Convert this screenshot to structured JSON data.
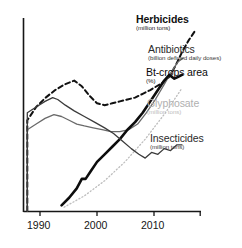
{
  "chart_data": {
    "type": "line",
    "title": "",
    "xlabel": "",
    "ylabel": "",
    "grid": false,
    "legend_position": "inline-right-of-line-ends",
    "xlim": [
      1988,
      2016
    ],
    "xticks": [
      1990,
      2000,
      2010
    ],
    "xtick_labels": [
      "1990",
      "2000",
      "2010"
    ],
    "ylim": [
      0,
      100
    ],
    "yticks": [],
    "ytick_labels": [],
    "note": "Unscaled/indexed vertical axis; each series plotted on its own arbitrary vertical scale with no y tick labels.",
    "series": [
      {
        "name": "Herbicides",
        "unit": "(million tons)",
        "style": "dashed",
        "color": "#111111",
        "width": 2.0,
        "label_color": "#111111",
        "label_bold": true,
        "x": [
          1988.6,
          1988.6,
          1990.0,
          1991.5,
          1993.0,
          1994.5,
          1996.0,
          1997.2,
          1998.4,
          1999.6,
          2000.8,
          2002.0,
          2003.2,
          2004.4,
          2005.6,
          2006.8,
          2008.0,
          2009.0,
          2010.0,
          2011.0,
          2012.0,
          2013.0,
          2014.0,
          2015.0
        ],
        "values": [
          0,
          48,
          55,
          60,
          64,
          67,
          69,
          66,
          61,
          57,
          56,
          57,
          58,
          59,
          60,
          62,
          64,
          66,
          68,
          71,
          77,
          84,
          90,
          95
        ]
      },
      {
        "name": "Antibiotics",
        "unit": "(billion defined daily doses)",
        "style": "solid",
        "color": "#6a6a6a",
        "width": 1.3,
        "label_color": "#2b2b2b",
        "label_bold": false,
        "x": [
          1988.6,
          1988.6,
          1990.0,
          1991.4,
          1992.8,
          1994.0,
          1995.2,
          1996.4,
          1997.6,
          1999.0,
          2000.4,
          2001.8,
          2003.2,
          2004.6,
          2006.0,
          2007.4,
          2008.8,
          2010.2,
          2011.4,
          2012.4,
          2013.2
        ],
        "values": [
          0,
          43,
          46,
          49,
          51,
          50,
          48,
          46,
          45,
          44,
          43,
          42,
          42,
          43,
          46,
          52,
          59,
          67,
          74,
          79,
          81
        ]
      },
      {
        "name": "Bt-crops area",
        "unit": "(%)",
        "style": "solid",
        "color": "#0d0d0d",
        "width": 2.6,
        "label_color": "#0a0a0a",
        "label_bold": false,
        "x": [
          1994.0,
          1995.2,
          1996.4,
          1997.2,
          1997.8,
          1998.6,
          1999.6,
          2000.8,
          2002.0,
          2003.2,
          2004.4,
          2005.6,
          2006.8,
          2008.0,
          2009.2,
          2010.2,
          2011.0,
          2011.8,
          2012.4,
          2013.0
        ],
        "values": [
          3,
          7,
          12,
          17,
          17,
          21,
          26,
          30,
          34,
          38,
          43,
          47,
          52,
          58,
          64,
          69,
          72,
          70,
          71,
          72
        ]
      },
      {
        "name": "Glyphosate",
        "unit": "(million tons)",
        "style": "dotted",
        "color": "#bdbdbd",
        "width": 1.3,
        "label_color": "#b0b0b0",
        "label_bold": false,
        "x": [
          1994.4,
          1996.0,
          1997.6,
          1999.2,
          2000.8,
          2002.4,
          2004.0,
          2005.6,
          2007.2,
          2008.8,
          2010.4,
          2012.0,
          2013.0
        ],
        "values": [
          2,
          5,
          8,
          12,
          16,
          21,
          26,
          32,
          38,
          45,
          52,
          60,
          65
        ]
      },
      {
        "name": "Insecticides",
        "unit": "(million tons)",
        "style": "solid",
        "color": "#3b3b3b",
        "width": 1.3,
        "label_color": "#2b2b2b",
        "label_bold": false,
        "x": [
          1988.6,
          1988.6,
          1990.0,
          1991.4,
          1992.6,
          1993.4,
          1994.6,
          1996.0,
          1997.6,
          1999.2,
          2000.8,
          2002.2,
          2003.6,
          2005.0,
          2006.2,
          2007.2,
          2008.2,
          2009.2,
          2010.2,
          2011.2,
          2012.2,
          2013.0
        ],
        "values": [
          0,
          52,
          55,
          58,
          60,
          59,
          56,
          53,
          50,
          47,
          44,
          41,
          37,
          33,
          30,
          28,
          31,
          30,
          33,
          32,
          35,
          35
        ]
      }
    ]
  },
  "axes": {
    "x_tick_labels": [
      "1990",
      "2000",
      "2010"
    ]
  }
}
